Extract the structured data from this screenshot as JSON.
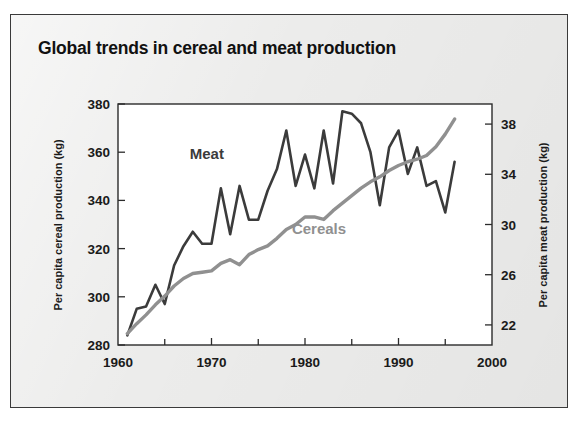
{
  "figure": {
    "title": "Global trends in cereal and meat production",
    "background_color": "#ececeb",
    "plot_background_color": "#ffffff",
    "border_color": "#3a3a3a"
  },
  "chart_data": {
    "type": "line",
    "title": "Global trends in cereal and meat production",
    "xlabel": "",
    "ylabel": "Per capita cereal production (kg)",
    "y2label": "Per capita meat production (kg)",
    "xlim": [
      1960,
      2000
    ],
    "ylim": [
      280,
      380
    ],
    "y2lim": [
      20.4,
      39.6
    ],
    "xticks": [
      1960,
      1970,
      1980,
      1990,
      2000
    ],
    "xticklabels": [
      "1960",
      "1970",
      "1980",
      "1990",
      "2000"
    ],
    "xminorticks": [
      1965,
      1975,
      1985,
      1995
    ],
    "yticks": [
      280,
      300,
      320,
      340,
      360,
      380
    ],
    "yticklabels": [
      "280",
      "300",
      "320",
      "340",
      "360",
      "380"
    ],
    "y2ticks": [
      22,
      26,
      30,
      34,
      38
    ],
    "y2ticklabels": [
      "22",
      "26",
      "30",
      "34",
      "38"
    ],
    "grid": false,
    "legend_position": "inline-annotations",
    "series": [
      {
        "name": "Meat",
        "color": "#3b3b3b",
        "axis": "left",
        "line_width": 2.6,
        "label_x": 1969.5,
        "label_y": 357,
        "x": [
          1961,
          1962,
          1963,
          1964,
          1965,
          1966,
          1967,
          1968,
          1969,
          1970,
          1971,
          1972,
          1973,
          1974,
          1975,
          1976,
          1977,
          1978,
          1979,
          1980,
          1981,
          1982,
          1983,
          1984,
          1985,
          1986,
          1987,
          1988,
          1989,
          1990,
          1991,
          1992,
          1993,
          1994,
          1995,
          1996
        ],
        "values": [
          284,
          295,
          296,
          305,
          297,
          313,
          321,
          327,
          322,
          322,
          345,
          326,
          346,
          332,
          332,
          344,
          353,
          369,
          346,
          359,
          345,
          369,
          347,
          377,
          376,
          372,
          360,
          338,
          362,
          369,
          351,
          362,
          346,
          348,
          335,
          356
        ]
      },
      {
        "name": "Cereals",
        "color": "#909090",
        "axis": "right",
        "line_width": 3.4,
        "label_x": 1981.5,
        "label_y": 326,
        "x": [
          1961,
          1962,
          1963,
          1964,
          1965,
          1966,
          1967,
          1968,
          1969,
          1970,
          1971,
          1972,
          1973,
          1974,
          1975,
          1976,
          1977,
          1978,
          1979,
          1980,
          1981,
          1982,
          1983,
          1984,
          1985,
          1986,
          1987,
          1988,
          1989,
          1990,
          1991,
          1992,
          1993,
          1994,
          1995,
          1996
        ],
        "values": [
          21.3,
          22.1,
          22.8,
          23.6,
          24.3,
          25.1,
          25.7,
          26.1,
          26.2,
          26.3,
          26.9,
          27.2,
          26.8,
          27.6,
          28.0,
          28.3,
          28.9,
          29.6,
          30.0,
          30.6,
          30.6,
          30.4,
          31.1,
          31.7,
          32.3,
          32.9,
          33.4,
          33.8,
          34.3,
          34.7,
          35.0,
          35.2,
          35.5,
          36.2,
          37.2,
          38.4
        ]
      }
    ]
  },
  "annotations": {
    "meat_label": "Meat",
    "cereals_label": "Cereals"
  }
}
